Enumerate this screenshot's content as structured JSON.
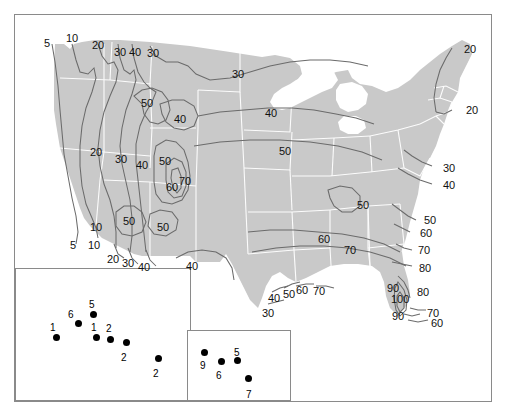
{
  "figure": {
    "type": "contour-map",
    "title": "",
    "land_fill": "#c9c9c9",
    "state_border": "#ffffff",
    "contour_color": "#6b6b6b",
    "frame_color": "#8a8a8a",
    "marker_color": "#000000"
  },
  "chart_data": {
    "type": "contour-map",
    "title": "",
    "subtitle": "",
    "xlabel": "",
    "ylabel": "",
    "units": "",
    "contour_levels": [
      5,
      10,
      20,
      30,
      40,
      50,
      60,
      70,
      80,
      90,
      100
    ],
    "contour_labels": [
      {
        "id": "c01",
        "value": "5",
        "x": 44,
        "y": 38,
        "region": "pacific-northwest-coast"
      },
      {
        "id": "c02",
        "value": "10",
        "x": 66,
        "y": 33,
        "region": "pacific-northwest-coast"
      },
      {
        "id": "c03",
        "value": "20",
        "x": 92,
        "y": 40,
        "region": "washington-north"
      },
      {
        "id": "c04",
        "value": "30",
        "x": 114,
        "y": 47,
        "region": "idaho-north"
      },
      {
        "id": "c05",
        "value": "40",
        "x": 129,
        "y": 47,
        "region": "idaho-north"
      },
      {
        "id": "c06",
        "value": "30",
        "x": 147,
        "y": 48,
        "region": "montana-north"
      },
      {
        "id": "c07",
        "value": "30",
        "x": 232,
        "y": 69,
        "region": "north-dakota"
      },
      {
        "id": "c08",
        "value": "50",
        "x": 141,
        "y": 98,
        "region": "wyoming-north"
      },
      {
        "id": "c09",
        "value": "40",
        "x": 174,
        "y": 114,
        "region": "wyoming-east"
      },
      {
        "id": "c10",
        "value": "40",
        "x": 265,
        "y": 108,
        "region": "minnesota-south"
      },
      {
        "id": "c11",
        "value": "20",
        "x": 90,
        "y": 147,
        "region": "nevada-north"
      },
      {
        "id": "c12",
        "value": "30",
        "x": 115,
        "y": 154,
        "region": "utah-north"
      },
      {
        "id": "c13",
        "value": "40",
        "x": 136,
        "y": 160,
        "region": "utah-east"
      },
      {
        "id": "c14",
        "value": "50",
        "x": 159,
        "y": 156,
        "region": "colorado-west"
      },
      {
        "id": "c15",
        "value": "50",
        "x": 279,
        "y": 146,
        "region": "iowa"
      },
      {
        "id": "c16",
        "value": "60",
        "x": 166,
        "y": 182,
        "region": "colorado-south"
      },
      {
        "id": "c17",
        "value": "70",
        "x": 179,
        "y": 176,
        "region": "colorado-south"
      },
      {
        "id": "c18",
        "value": "10",
        "x": 90,
        "y": 222,
        "region": "california-south"
      },
      {
        "id": "c19",
        "value": "5",
        "x": 70,
        "y": 240,
        "region": "california-south-coast"
      },
      {
        "id": "c20",
        "value": "10",
        "x": 88,
        "y": 240,
        "region": "california-south-coast"
      },
      {
        "id": "c21",
        "value": "50",
        "x": 123,
        "y": 216,
        "region": "arizona-north"
      },
      {
        "id": "c22",
        "value": "50",
        "x": 157,
        "y": 222,
        "region": "new-mexico-north"
      },
      {
        "id": "c23",
        "value": "20",
        "x": 107,
        "y": 254,
        "region": "arizona-south"
      },
      {
        "id": "c24",
        "value": "30",
        "x": 122,
        "y": 258,
        "region": "arizona-south"
      },
      {
        "id": "c25",
        "value": "40",
        "x": 138,
        "y": 262,
        "region": "new-mexico-south"
      },
      {
        "id": "c26",
        "value": "40",
        "x": 186,
        "y": 261,
        "region": "texas-west"
      },
      {
        "id": "c27",
        "value": "50",
        "x": 357,
        "y": 200,
        "region": "tennessee"
      },
      {
        "id": "c28",
        "value": "60",
        "x": 318,
        "y": 234,
        "region": "arkansas-mississippi"
      },
      {
        "id": "c29",
        "value": "70",
        "x": 344,
        "y": 245,
        "region": "mississippi-alabama"
      },
      {
        "id": "c30",
        "value": "30",
        "x": 262,
        "y": 308,
        "region": "texas-coast-south"
      },
      {
        "id": "c31",
        "value": "40",
        "x": 268,
        "y": 293,
        "region": "texas-coast"
      },
      {
        "id": "c32",
        "value": "50",
        "x": 283,
        "y": 289,
        "region": "texas-coast"
      },
      {
        "id": "c33",
        "value": "60",
        "x": 296,
        "y": 285,
        "region": "louisiana-coast"
      },
      {
        "id": "c34",
        "value": "70",
        "x": 313,
        "y": 286,
        "region": "louisiana-coast"
      },
      {
        "id": "c35",
        "value": "20",
        "x": 464,
        "y": 44,
        "region": "maine-coast"
      },
      {
        "id": "c36",
        "value": "20",
        "x": 466,
        "y": 105,
        "region": "new-england-coast"
      },
      {
        "id": "c37",
        "value": "30",
        "x": 443,
        "y": 163,
        "region": "mid-atlantic-coast"
      },
      {
        "id": "c38",
        "value": "40",
        "x": 443,
        "y": 180,
        "region": "mid-atlantic-coast"
      },
      {
        "id": "c39",
        "value": "50",
        "x": 424,
        "y": 215,
        "region": "carolina-coast"
      },
      {
        "id": "c40",
        "value": "60",
        "x": 420,
        "y": 228,
        "region": "carolina-coast"
      },
      {
        "id": "c41",
        "value": "70",
        "x": 418,
        "y": 245,
        "region": "georgia-coast"
      },
      {
        "id": "c42",
        "value": "80",
        "x": 419,
        "y": 263,
        "region": "florida-north"
      },
      {
        "id": "c43",
        "value": "80",
        "x": 417,
        "y": 287,
        "region": "florida-east"
      },
      {
        "id": "c44",
        "value": "90",
        "x": 387,
        "y": 283,
        "region": "florida-west"
      },
      {
        "id": "c45",
        "value": "100",
        "x": 391,
        "y": 294,
        "region": "florida-central"
      },
      {
        "id": "c46",
        "value": "90",
        "x": 392,
        "y": 311,
        "region": "florida-south"
      },
      {
        "id": "c47",
        "value": "70",
        "x": 427,
        "y": 308,
        "region": "florida-south-east"
      },
      {
        "id": "c48",
        "value": "60",
        "x": 431,
        "y": 318,
        "region": "florida-keys"
      }
    ],
    "insets": [
      {
        "name": "Alaska",
        "box": {
          "x": 15,
          "y": 268,
          "w": 176,
          "h": 133
        },
        "points": [
          {
            "label": "1",
            "dot_x": 56,
            "dot_y": 337,
            "lbl_x": 50,
            "lbl_y": 323
          },
          {
            "label": "6",
            "dot_x": 78,
            "dot_y": 323,
            "lbl_x": 68,
            "lbl_y": 310
          },
          {
            "label": "5",
            "dot_x": 93,
            "dot_y": 314,
            "lbl_x": 89,
            "lbl_y": 300
          },
          {
            "label": "1",
            "dot_x": 96,
            "dot_y": 337,
            "lbl_x": 91,
            "lbl_y": 323
          },
          {
            "label": "2",
            "dot_x": 110,
            "dot_y": 339,
            "lbl_x": 106,
            "lbl_y": 324
          },
          {
            "label": "2",
            "dot_x": 126,
            "dot_y": 342,
            "lbl_x": 121,
            "lbl_y": 353
          },
          {
            "label": "2",
            "dot_x": 158,
            "dot_y": 358,
            "lbl_x": 153,
            "lbl_y": 369
          }
        ]
      },
      {
        "name": "Hawaii",
        "box": {
          "x": 187,
          "y": 330,
          "w": 104,
          "h": 71
        },
        "points": [
          {
            "label": "9",
            "dot_x": 204,
            "dot_y": 352,
            "lbl_x": 200,
            "lbl_y": 361
          },
          {
            "label": "6",
            "dot_x": 221,
            "dot_y": 361,
            "lbl_x": 216,
            "lbl_y": 371
          },
          {
            "label": "5",
            "dot_x": 237,
            "dot_y": 360,
            "lbl_x": 234,
            "lbl_y": 348
          },
          {
            "label": "7",
            "dot_x": 248,
            "dot_y": 378,
            "lbl_x": 246,
            "lbl_y": 390
          }
        ]
      }
    ],
    "legend": [],
    "grid": false
  }
}
